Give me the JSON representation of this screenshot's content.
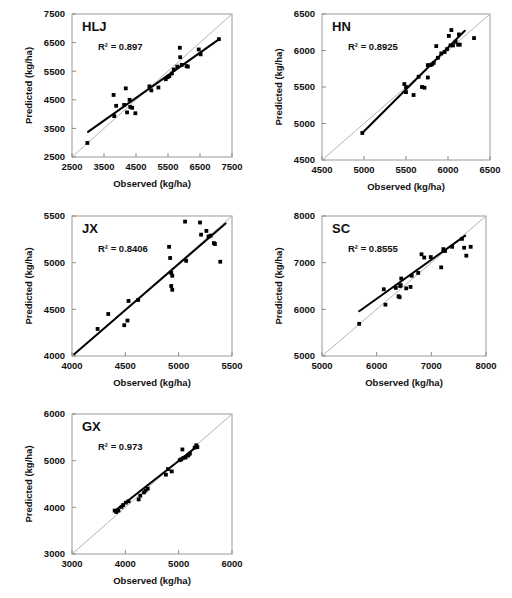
{
  "figure": {
    "type": "scatter-grid",
    "panel_count": 5,
    "axis_titles": {
      "x": "Observed (kg/ha)",
      "y": "Predicted (kg/ha)"
    },
    "units": "kg/ha",
    "marker": "filled-square",
    "marker_color": "#000000",
    "fit_line_color": "#000000",
    "one_to_one_line_color": "#b4b4b4",
    "frame_color": "#9a9a9a",
    "background": "#ffffff"
  },
  "chart_data": [
    {
      "type": "scatter",
      "title": "HLJ",
      "r2_label": "R² = 0.897",
      "r2": 0.897,
      "xlabel": "Observed (kg/ha)",
      "ylabel": "Predicted (kg/ha)",
      "xlim": [
        2500,
        7500
      ],
      "ylim": [
        2500,
        7500
      ],
      "xticks": [
        2500,
        3500,
        4500,
        5500,
        6500,
        7500
      ],
      "yticks": [
        2500,
        3500,
        4500,
        5500,
        6500,
        7500
      ],
      "xtick_labels": [
        "2500",
        "3500",
        "4500",
        "5500",
        "6500",
        "7500"
      ],
      "ytick_labels": [
        "2500",
        "3500",
        "4500",
        "5500",
        "6500",
        "7500"
      ],
      "grid": false,
      "legend": "none",
      "fit_line": {
        "x": [
          3000,
          7100
        ],
        "y": [
          3380,
          6620
        ]
      },
      "one_to_one": true,
      "points": [
        [
          2980,
          2990
        ],
        [
          3800,
          4670
        ],
        [
          3820,
          3930
        ],
        [
          3880,
          4290
        ],
        [
          4130,
          4320
        ],
        [
          4180,
          4900
        ],
        [
          4220,
          4060
        ],
        [
          4300,
          4500
        ],
        [
          4320,
          4250
        ],
        [
          4380,
          4220
        ],
        [
          4480,
          4030
        ],
        [
          4920,
          4970
        ],
        [
          4980,
          4830
        ],
        [
          5200,
          4930
        ],
        [
          5430,
          5220
        ],
        [
          5490,
          5290
        ],
        [
          5540,
          5330
        ],
        [
          5620,
          5420
        ],
        [
          5680,
          5560
        ],
        [
          5790,
          5660
        ],
        [
          5870,
          6320
        ],
        [
          5880,
          5990
        ],
        [
          5930,
          5720
        ],
        [
          6080,
          5680
        ],
        [
          6120,
          5660
        ],
        [
          6460,
          6260
        ],
        [
          6520,
          6090
        ],
        [
          7090,
          6620
        ]
      ]
    },
    {
      "type": "scatter",
      "title": "HN",
      "r2_label": "R² = 0.8925",
      "r2": 0.8925,
      "xlabel": "Observed (kg/ha)",
      "ylabel": "Predicted (kg/ha)",
      "xlim": [
        4500,
        6500
      ],
      "ylim": [
        4500,
        6500
      ],
      "xticks": [
        4500,
        5000,
        5500,
        6000,
        6500
      ],
      "yticks": [
        4500,
        5000,
        5500,
        6000,
        6500
      ],
      "xtick_labels": [
        "4500",
        "5000",
        "5500",
        "6000",
        "6500"
      ],
      "ytick_labels": [
        "4500",
        "5000",
        "5500",
        "6000",
        "6500"
      ],
      "grid": false,
      "legend": "none",
      "fit_line": {
        "x": [
          4980,
          6200
        ],
        "y": [
          4870,
          6270
        ]
      },
      "one_to_one": true,
      "points": [
        [
          4980,
          4870
        ],
        [
          5480,
          5540
        ],
        [
          5500,
          5430
        ],
        [
          5500,
          5500
        ],
        [
          5590,
          5390
        ],
        [
          5650,
          5640
        ],
        [
          5690,
          5500
        ],
        [
          5720,
          5490
        ],
        [
          5760,
          5630
        ],
        [
          5760,
          5800
        ],
        [
          5790,
          5800
        ],
        [
          5810,
          5810
        ],
        [
          5830,
          5830
        ],
        [
          5860,
          6060
        ],
        [
          5880,
          5900
        ],
        [
          5920,
          5960
        ],
        [
          5960,
          5980
        ],
        [
          5990,
          6020
        ],
        [
          6010,
          6200
        ],
        [
          6030,
          6070
        ],
        [
          6040,
          6280
        ],
        [
          6060,
          6070
        ],
        [
          6090,
          6120
        ],
        [
          6120,
          6080
        ],
        [
          6130,
          6220
        ],
        [
          6140,
          6080
        ],
        [
          6310,
          6170
        ]
      ]
    },
    {
      "type": "scatter",
      "title": "JX",
      "r2_label": "R² = 0.8406",
      "r2": 0.8406,
      "xlabel": "Observed (kg/ha)",
      "ylabel": "Predicted (kg/ha)",
      "xlim": [
        4000,
        5500
      ],
      "ylim": [
        4000,
        5500
      ],
      "xticks": [
        4000,
        4500,
        5000,
        5500
      ],
      "yticks": [
        4000,
        4500,
        5000,
        5500
      ],
      "xtick_labels": [
        "4000",
        "4500",
        "5000",
        "5500"
      ],
      "ytick_labels": [
        "4000",
        "4500",
        "5000",
        "5500"
      ],
      "grid": false,
      "legend": "none",
      "fit_line": {
        "x": [
          4020,
          5440
        ],
        "y": [
          4020,
          5420
        ]
      },
      "one_to_one": true,
      "points": [
        [
          4240,
          4290
        ],
        [
          4340,
          4450
        ],
        [
          4490,
          4330
        ],
        [
          4520,
          4380
        ],
        [
          4530,
          4590
        ],
        [
          4620,
          4600
        ],
        [
          4910,
          5170
        ],
        [
          4920,
          5050
        ],
        [
          4930,
          4890
        ],
        [
          4930,
          4750
        ],
        [
          4940,
          4710
        ],
        [
          4940,
          4860
        ],
        [
          5060,
          5440
        ],
        [
          5070,
          5020
        ],
        [
          5200,
          5430
        ],
        [
          5210,
          5300
        ],
        [
          5260,
          5340
        ],
        [
          5280,
          5280
        ],
        [
          5300,
          5290
        ],
        [
          5330,
          5210
        ],
        [
          5340,
          5200
        ],
        [
          5390,
          5010
        ]
      ]
    },
    {
      "type": "scatter",
      "title": "SC",
      "r2_label": "R² = 0.8555",
      "r2": 0.8555,
      "xlabel": "Observed (kg/ha)",
      "ylabel": "Predicted (kg/ha)",
      "xlim": [
        5000,
        8000
      ],
      "ylim": [
        5000,
        8000
      ],
      "xticks": [
        5000,
        6000,
        7000,
        8000
      ],
      "yticks": [
        5000,
        6000,
        7000,
        8000
      ],
      "xtick_labels": [
        "5000",
        "6000",
        "7000",
        "8000"
      ],
      "ytick_labels": [
        "5000",
        "6000",
        "7000",
        "8000"
      ],
      "grid": false,
      "legend": "none",
      "fit_line": {
        "x": [
          5680,
          7620
        ],
        "y": [
          5960,
          7580
        ]
      },
      "one_to_one": true,
      "points": [
        [
          5680,
          5690
        ],
        [
          6130,
          6430
        ],
        [
          6160,
          6100
        ],
        [
          6350,
          6460
        ],
        [
          6400,
          6280
        ],
        [
          6420,
          6260
        ],
        [
          6430,
          6500
        ],
        [
          6440,
          6520
        ],
        [
          6450,
          6660
        ],
        [
          6540,
          6450
        ],
        [
          6620,
          6480
        ],
        [
          6640,
          6720
        ],
        [
          6760,
          6780
        ],
        [
          6820,
          7180
        ],
        [
          6870,
          7110
        ],
        [
          6990,
          7120
        ],
        [
          7180,
          6900
        ],
        [
          7220,
          7290
        ],
        [
          7250,
          7250
        ],
        [
          7380,
          7340
        ],
        [
          7560,
          7510
        ],
        [
          7600,
          7320
        ],
        [
          7640,
          7150
        ],
        [
          7720,
          7340
        ]
      ]
    },
    {
      "type": "scatter",
      "title": "GX",
      "r2_label": "R² = 0.973",
      "r2": 0.973,
      "xlabel": "Observed (kg/ha)",
      "ylabel": "Predicted (kg/ha)",
      "xlim": [
        3000,
        6000
      ],
      "ylim": [
        3000,
        6000
      ],
      "xticks": [
        3000,
        4000,
        5000,
        6000
      ],
      "yticks": [
        3000,
        4000,
        5000,
        6000
      ],
      "xtick_labels": [
        "3000",
        "4000",
        "5000",
        "6000"
      ],
      "ytick_labels": [
        "3000",
        "4000",
        "5000",
        "6000"
      ],
      "grid": false,
      "legend": "none",
      "fit_line": {
        "x": [
          3800,
          5350
        ],
        "y": [
          3920,
          5310
        ]
      },
      "one_to_one": true,
      "points": [
        [
          3800,
          3930
        ],
        [
          3830,
          3900
        ],
        [
          3870,
          3930
        ],
        [
          3930,
          4010
        ],
        [
          3960,
          4050
        ],
        [
          4010,
          4100
        ],
        [
          4060,
          4130
        ],
        [
          4250,
          4170
        ],
        [
          4280,
          4250
        ],
        [
          4350,
          4320
        ],
        [
          4380,
          4360
        ],
        [
          4420,
          4400
        ],
        [
          4760,
          4700
        ],
        [
          4800,
          4820
        ],
        [
          4870,
          4770
        ],
        [
          5020,
          5010
        ],
        [
          5050,
          5030
        ],
        [
          5070,
          5240
        ],
        [
          5090,
          5060
        ],
        [
          5130,
          5070
        ],
        [
          5180,
          5110
        ],
        [
          5210,
          5150
        ],
        [
          5300,
          5280
        ],
        [
          5330,
          5330
        ],
        [
          5350,
          5290
        ]
      ]
    }
  ]
}
